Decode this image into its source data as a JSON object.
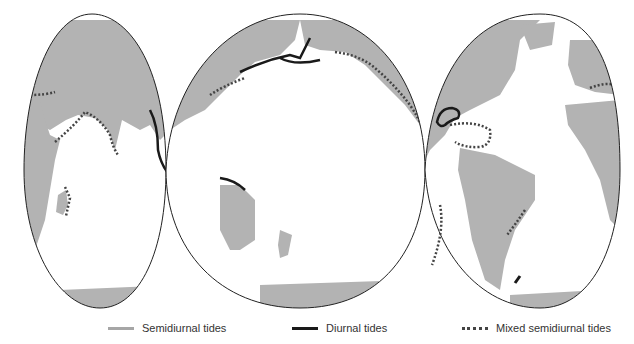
{
  "map": {
    "title": "Global distribution of tide types",
    "projection": "interrupted (three-lobe) world map",
    "colors": {
      "land": "#b3b3b3",
      "ocean": "#ffffff",
      "outline": "#222222",
      "semidiurnal": "#a6a6a6",
      "diurnal": "#1a1a1a",
      "mixed": "#444444"
    },
    "lobes": [
      "Eurasia / Africa / Indian Ocean",
      "Pacific Ocean",
      "Americas / Atlantic Ocean"
    ]
  },
  "legend": {
    "items": [
      {
        "label": "Semidiurnal tides",
        "style": "solid-gray"
      },
      {
        "label": "Diurnal tides",
        "style": "solid-black"
      },
      {
        "label": "Mixed semidiurnal tides",
        "style": "dotted-black"
      }
    ]
  }
}
